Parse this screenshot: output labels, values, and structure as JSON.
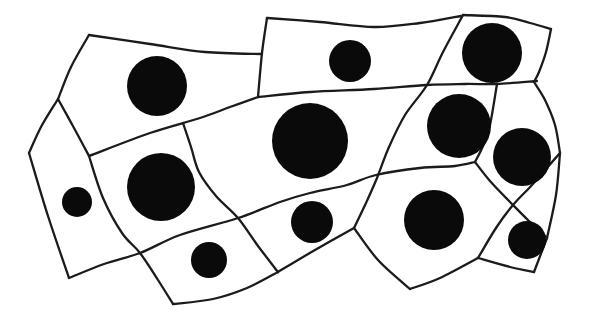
{
  "figure": {
    "cell_count": 13,
    "nucleus_count": 12,
    "canvas": {
      "width": 594,
      "height": 324,
      "background": "#ffffff"
    },
    "style": {
      "stroke_color": "#1b1b1b",
      "stroke_width": 2.3,
      "nucleus_fill": "#0a0a0a"
    },
    "edges": [
      {
        "id": "outline-topleft-top",
        "points": [
          [
            89,
            35
          ],
          [
            150,
            44
          ],
          [
            205,
            52
          ],
          [
            262,
            54
          ]
        ]
      },
      {
        "id": "cell2-left-vertical",
        "points": [
          [
            267,
            18
          ],
          [
            262,
            53
          ],
          [
            258,
            97
          ]
        ]
      },
      {
        "id": "cell2-top",
        "points": [
          [
            267,
            18
          ],
          [
            320,
            22
          ],
          [
            374,
            27
          ],
          [
            420,
            23
          ],
          [
            461,
            16
          ]
        ]
      },
      {
        "id": "cell3-top",
        "points": [
          [
            463,
            15
          ],
          [
            505,
            17
          ],
          [
            530,
            23
          ],
          [
            551,
            29
          ]
        ]
      },
      {
        "id": "cell3-right",
        "points": [
          [
            551,
            29
          ],
          [
            546,
            52
          ],
          [
            539,
            72
          ],
          [
            534,
            82
          ]
        ]
      },
      {
        "id": "mid-horizontal",
        "points": [
          [
            258,
            97
          ],
          [
            310,
            92
          ],
          [
            374,
            89
          ],
          [
            427,
            85
          ],
          [
            465,
            84
          ],
          [
            497,
            84
          ],
          [
            537,
            81
          ]
        ]
      },
      {
        "id": "main-diagonal",
        "points": [
          [
            463,
            15
          ],
          [
            443,
            52
          ],
          [
            427,
            85
          ],
          [
            405,
            115
          ],
          [
            389,
            147
          ],
          [
            377,
            178
          ],
          [
            366,
            203
          ],
          [
            354,
            228
          ]
        ]
      },
      {
        "id": "outline-left-upper",
        "points": [
          [
            89,
            35
          ],
          [
            71,
            67
          ],
          [
            58,
            99
          ]
        ]
      },
      {
        "id": "outline-left-mid",
        "points": [
          [
            58,
            99
          ],
          [
            41,
            127
          ],
          [
            29,
            153
          ]
        ]
      },
      {
        "id": "outline-left-lower",
        "points": [
          [
            29,
            153
          ],
          [
            48,
            216
          ],
          [
            69,
            278
          ]
        ]
      },
      {
        "id": "branch-b-d",
        "points": [
          [
            58,
            99
          ],
          [
            74,
            128
          ],
          [
            89,
            156
          ]
        ]
      },
      {
        "id": "ridge-d-f",
        "points": [
          [
            89,
            156
          ],
          [
            150,
            133
          ],
          [
            200,
            118
          ],
          [
            230,
            107
          ],
          [
            258,
            97
          ]
        ]
      },
      {
        "id": "left-diagonal",
        "points": [
          [
            89,
            156
          ],
          [
            103,
            198
          ],
          [
            122,
            233
          ],
          [
            140,
            253
          ],
          [
            158,
            280
          ],
          [
            173,
            304
          ]
        ]
      },
      {
        "id": "long-separator-q",
        "points": [
          [
            69,
            278
          ],
          [
            104,
            264
          ],
          [
            140,
            253
          ],
          [
            180,
            235
          ],
          [
            238,
            218
          ],
          [
            280,
            202
          ],
          [
            310,
            193
          ],
          [
            347,
            185
          ],
          [
            376,
            175
          ],
          [
            420,
            168
          ],
          [
            455,
            166
          ],
          [
            475,
            162
          ]
        ]
      },
      {
        "id": "branch-p",
        "points": [
          [
            183,
            123
          ],
          [
            191,
            147
          ],
          [
            199,
            172
          ],
          [
            216,
            196
          ],
          [
            238,
            218
          ],
          [
            258,
            246
          ],
          [
            278,
            272
          ]
        ]
      },
      {
        "id": "bottom-outline-r",
        "points": [
          [
            173,
            304
          ],
          [
            213,
            299
          ],
          [
            247,
            288
          ],
          [
            278,
            272
          ]
        ]
      },
      {
        "id": "bottom-outline-s",
        "points": [
          [
            278,
            272
          ],
          [
            315,
            250
          ],
          [
            354,
            228
          ]
        ]
      },
      {
        "id": "bottom-outline-apex",
        "points": [
          [
            354,
            228
          ],
          [
            378,
            260
          ],
          [
            410,
            289
          ]
        ]
      },
      {
        "id": "bottom-outline-t",
        "points": [
          [
            410,
            289
          ],
          [
            440,
            278
          ],
          [
            478,
            258
          ]
        ]
      },
      {
        "id": "cell12-bottom",
        "points": [
          [
            478,
            258
          ],
          [
            510,
            267
          ],
          [
            534,
            272
          ]
        ]
      },
      {
        "id": "cell12-right",
        "points": [
          [
            534,
            272
          ],
          [
            547,
            238
          ]
        ]
      },
      {
        "id": "right-outline-wedge",
        "points": [
          [
            560,
            153
          ],
          [
            556,
            195
          ],
          [
            547,
            238
          ]
        ]
      },
      {
        "id": "cross-line-a",
        "points": [
          [
            560,
            153
          ],
          [
            545,
            170
          ],
          [
            532,
            185
          ],
          [
            513,
            205
          ],
          [
            496,
            228
          ],
          [
            478,
            258
          ]
        ]
      },
      {
        "id": "cross-line-b",
        "points": [
          [
            475,
            162
          ],
          [
            490,
            181
          ],
          [
            513,
            205
          ],
          [
            530,
            222
          ],
          [
            547,
            238
          ]
        ]
      },
      {
        "id": "sep-cell4-cell5",
        "points": [
          [
            497,
            84
          ],
          [
            490,
            125
          ],
          [
            483,
            146
          ],
          [
            475,
            162
          ]
        ]
      },
      {
        "id": "right-outline-curve",
        "points": [
          [
            534,
            82
          ],
          [
            545,
            100
          ],
          [
            555,
            125
          ],
          [
            560,
            153
          ]
        ]
      }
    ],
    "nuclei": [
      {
        "id": "nucleus-1",
        "cx": 157,
        "cy": 86,
        "r": 30
      },
      {
        "id": "nucleus-2",
        "cx": 350,
        "cy": 61,
        "r": 21
      },
      {
        "id": "nucleus-3",
        "cx": 492,
        "cy": 53,
        "r": 30
      },
      {
        "id": "nucleus-4",
        "cx": 459,
        "cy": 126,
        "r": 32
      },
      {
        "id": "nucleus-5",
        "cx": 522,
        "cy": 157,
        "r": 29
      },
      {
        "id": "nucleus-6",
        "cx": 161,
        "cy": 187,
        "r": 34
      },
      {
        "id": "nucleus-7",
        "cx": 77,
        "cy": 202,
        "r": 15
      },
      {
        "id": "nucleus-8",
        "cx": 310,
        "cy": 141,
        "r": 38
      },
      {
        "id": "nucleus-9",
        "cx": 209,
        "cy": 260,
        "r": 18
      },
      {
        "id": "nucleus-10",
        "cx": 312,
        "cy": 222,
        "r": 21
      },
      {
        "id": "nucleus-11",
        "cx": 434,
        "cy": 220,
        "r": 30
      },
      {
        "id": "nucleus-12",
        "cx": 527,
        "cy": 240,
        "r": 19
      }
    ]
  }
}
